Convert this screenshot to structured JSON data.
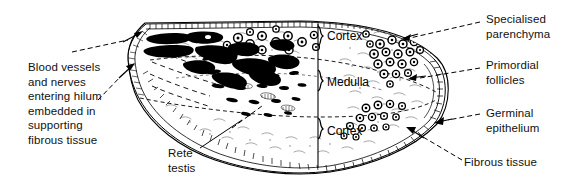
{
  "figure": {
    "ink_color": "#000000",
    "background_color": "#ffffff"
  },
  "labels": {
    "blood_vessels": "Blood vessels\nand nerves\nentering hilum\nembedded in\nsupporting\nfibrous tissue",
    "rete_testis": "Rete\ntestis",
    "specialised_parenchyma": "Specialised\nparenchyma",
    "primordial_follicles": "Primordial\nfollicles",
    "germinal_epithelium": "Germinal\nepithelium",
    "fibrous_tissue": "Fibrous tissue"
  },
  "regions": {
    "cortex_top": "Cortex",
    "medulla": "Medulla",
    "cortex_bottom": "Cortex"
  },
  "icons": {
    "leader_line": "dashed-leader-line-icon",
    "arrow_head": "arrow-head-icon",
    "brace": "curly-brace-icon",
    "follicle": "follicle-circle-icon",
    "vessel": "blood-vessel-blob-icon",
    "epithelium": "hatched-epithelium-band-icon"
  }
}
